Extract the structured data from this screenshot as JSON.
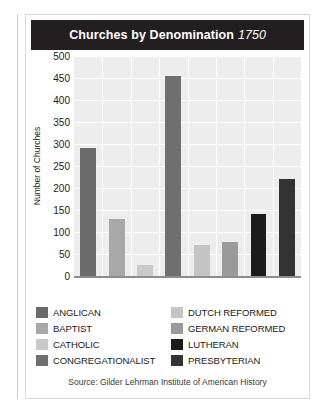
{
  "card": {
    "title_main": "Churches by Denomination",
    "title_year": "1750",
    "source": "Source: Gilder Lehrman Institute of American History"
  },
  "chart_data": {
    "type": "bar",
    "title": "Churches by Denomination 1750",
    "subtitle": "1750",
    "xlabel": "",
    "ylabel": "Number of Churches",
    "ylim": [
      0,
      500
    ],
    "yticks": [
      0,
      50,
      100,
      150,
      200,
      250,
      300,
      350,
      400,
      450,
      500
    ],
    "grid": true,
    "legend_position": "below-plot",
    "categories": [
      "ANGLICAN",
      "BAPTIST",
      "CATHOLIC",
      "CONGREGATIONALIST",
      "DUTCH REFORMED",
      "GERMAN REFORMED",
      "LUTHERAN",
      "PRESBYTERIAN"
    ],
    "values": [
      290,
      130,
      25,
      455,
      70,
      78,
      142,
      220
    ],
    "colors": [
      "#6b6b6b",
      "#a8a8a8",
      "#c9c9c9",
      "#6f6f6f",
      "#c4c4c4",
      "#9a9a9a",
      "#1c1c1c",
      "#333333"
    ],
    "annotation": "Source: Gilder Lehrman Institute of American History"
  },
  "legend": {
    "items": [
      {
        "label": "ANGLICAN",
        "color": "#6b6b6b"
      },
      {
        "label": "DUTCH REFORMED",
        "color": "#c4c4c4"
      },
      {
        "label": "BAPTIST",
        "color": "#a8a8a8"
      },
      {
        "label": "GERMAN REFORMED",
        "color": "#9a9a9a"
      },
      {
        "label": "CATHOLIC",
        "color": "#c9c9c9"
      },
      {
        "label": "LUTHERAN",
        "color": "#1c1c1c"
      },
      {
        "label": "CONGREGATIONALIST",
        "color": "#6f6f6f"
      },
      {
        "label": "PRESBYTERIAN",
        "color": "#333333"
      }
    ]
  },
  "theme": {
    "title_bar_bg": "#231f20",
    "plot_bg": "#ededed",
    "gridline": "#ffffff",
    "axis": "#8c8c8c",
    "card_border": "#d8d8d8",
    "text": "#1a1a1a"
  }
}
